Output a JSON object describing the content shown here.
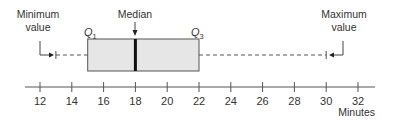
{
  "chart_data": {
    "type": "boxplot",
    "title": "",
    "xlabel": "Minutes",
    "ylabel": "",
    "xlim": [
      11,
      33
    ],
    "ticks": [
      12,
      14,
      16,
      18,
      20,
      22,
      24,
      26,
      28,
      30,
      32
    ],
    "tick_labels": [
      "12",
      "14",
      "16",
      "18",
      "20",
      "22",
      "24",
      "26",
      "28",
      "30",
      "32"
    ],
    "grid": false,
    "summary": {
      "minimum": 13,
      "q1": 15,
      "median": 18,
      "q3": 22,
      "maximum": 30
    },
    "annotations": [
      {
        "text_lines": [
          "Minimum",
          "value"
        ],
        "points_to": "minimum"
      },
      {
        "text_lines": [
          "Median"
        ],
        "points_to": "median"
      },
      {
        "text_lines": [
          "Maximum",
          "value"
        ],
        "points_to": "maximum"
      },
      {
        "text": "Q",
        "subscript": "1",
        "points_to": "q1"
      },
      {
        "text": "Q",
        "subscript": "3",
        "points_to": "q3"
      }
    ]
  },
  "labels": {
    "minimum_line1": "Minimum",
    "minimum_line2": "value",
    "median": "Median",
    "maximum_line1": "Maximum",
    "maximum_line2": "value",
    "q1_main": "Q",
    "q1_sub": "1",
    "q3_main": "Q",
    "q3_sub": "3",
    "axis_unit": "Minutes"
  },
  "colors": {
    "box_fill": "#e6e6e6",
    "stroke": "#444444",
    "median_line": "#111111",
    "text": "#333333"
  }
}
